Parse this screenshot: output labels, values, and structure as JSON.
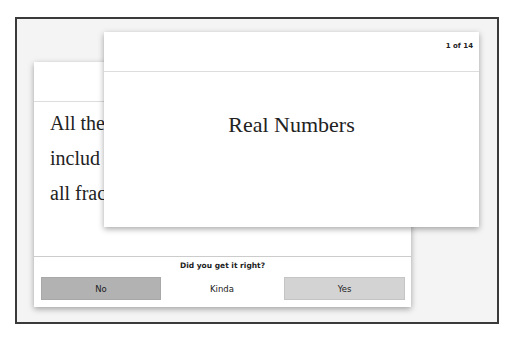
{
  "flashcards": {
    "counter": "1 of 14",
    "front": {
      "term": "Real Numbers"
    },
    "back": {
      "definition_lines": [
        "All the",
        "includ",
        "all frac"
      ]
    }
  },
  "rating": {
    "prompt": "Did you get it right?",
    "buttons": {
      "no": "No",
      "kinda": "Kinda",
      "yes": "Yes"
    }
  }
}
